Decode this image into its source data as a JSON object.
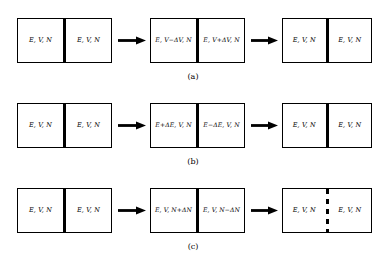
{
  "figure": {
    "background_color": "#ffffff",
    "line_color": "#000000",
    "base_state": "E, V, N",
    "rows": [
      {
        "id": "a",
        "caption": "(a)",
        "process": "volume-exchange",
        "boxes": [
          {
            "divider": "solid",
            "left_label": "E, V, N",
            "right_label": "E, V, N"
          },
          {
            "divider": "solid",
            "left_label": "E, V−ΔV, N",
            "right_label": "E, V+ΔV, N"
          },
          {
            "divider": "solid",
            "left_label": "E, V, N",
            "right_label": "E, V, N"
          }
        ],
        "arrows": [
          "arrow-right",
          "arrow-right"
        ]
      },
      {
        "id": "b",
        "caption": "(b)",
        "process": "energy-exchange",
        "boxes": [
          {
            "divider": "solid",
            "left_label": "E, V, N",
            "right_label": "E, V, N"
          },
          {
            "divider": "solid",
            "left_label": "E+ΔE, V, N",
            "right_label": "E−ΔE, V, N"
          },
          {
            "divider": "solid",
            "left_label": "E, V, N",
            "right_label": "E, V, N"
          }
        ],
        "arrows": [
          "arrow-right",
          "arrow-right"
        ]
      },
      {
        "id": "c",
        "caption": "(c)",
        "process": "particle-exchange",
        "boxes": [
          {
            "divider": "solid",
            "left_label": "E, V, N",
            "right_label": "E, V, N"
          },
          {
            "divider": "solid",
            "left_label": "E, V, N+ΔN",
            "right_label": "E, V, N−ΔN"
          },
          {
            "divider": "dashed",
            "left_label": "E, V, N",
            "right_label": "E, V, N"
          }
        ],
        "arrows": [
          "arrow-right",
          "arrow-right"
        ]
      }
    ]
  }
}
